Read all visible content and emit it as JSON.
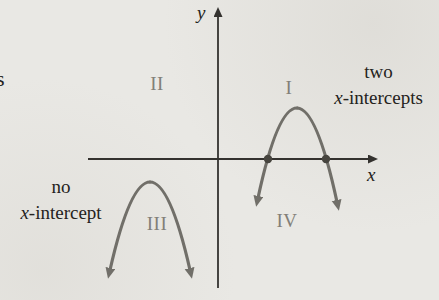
{
  "colors": {
    "background": "#e9e8e4",
    "axis": "#34322f",
    "curve": "#716f69",
    "dot": "#47453f",
    "text": "#242220",
    "quadrant": "#827f78"
  },
  "axes": {
    "x_label": "x",
    "y_label": "y"
  },
  "quadrants": {
    "q1": "I",
    "q2": "II",
    "q3": "III",
    "q4": "IV"
  },
  "annotations": {
    "two_intercepts": {
      "line1": "two",
      "x_italic": "x",
      "suffix": "-intercepts"
    },
    "no_intercept": {
      "line1": "no",
      "x_italic": "x",
      "suffix": "-intercept"
    },
    "edge_fragment": "s"
  },
  "points": {
    "intercept_left": {
      "cx": "268",
      "cy": "159",
      "r": "4.2"
    },
    "intercept_right": {
      "cx": "326",
      "cy": "159",
      "r": "4.2"
    }
  }
}
